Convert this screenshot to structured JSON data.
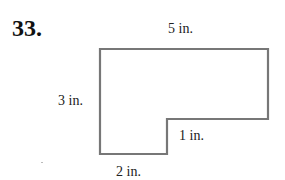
{
  "problem": {
    "number": "33."
  },
  "figure": {
    "type": "L-shaped polygon",
    "stroke_color": "#777777",
    "labels": {
      "top": "5 in.",
      "left": "3 in.",
      "notch": "1 in.",
      "bottom": "2 in."
    },
    "dimensions": {
      "top_length_in": 5,
      "left_height_in": 3,
      "notch_height_in": 1,
      "bottom_length_in": 2
    }
  }
}
